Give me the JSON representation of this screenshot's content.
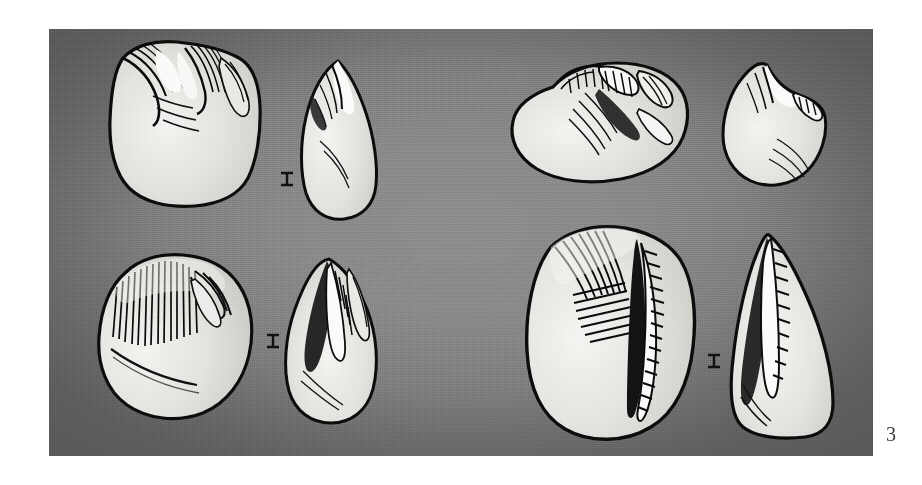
{
  "page": {
    "background_color": "#ffffff",
    "width": 922,
    "height": 485
  },
  "plate": {
    "label": "scientific-illustration-plate",
    "background_color": "#8a8a8a",
    "edge_color": "#686868",
    "x": 49,
    "y": 29,
    "width": 824,
    "height": 427,
    "medium": "stippled pen-and-ink drawing on gray photographic ground",
    "subject": "fossil tooth specimens"
  },
  "figure": {
    "number": "3",
    "number_color": "#3b3b3b"
  },
  "specimens": [
    {
      "id": "specimen-1",
      "position": "top-left",
      "views": [
        {
          "name": "occlusal-view",
          "x": 93,
          "y": 36,
          "width": 185,
          "height": 175,
          "features": "rounded-square crown, hatched wear facets upper margin, dense stipple lower right"
        },
        {
          "name": "lateral-view",
          "x": 290,
          "y": 55,
          "width": 90,
          "height": 165,
          "features": "pointed apex, tall narrow profile, stipple shading right side"
        }
      ],
      "connector": {
        "name": "view-link-mark",
        "x": 277,
        "y": 151,
        "width": 15,
        "height": 10
      }
    },
    {
      "id": "specimen-2",
      "position": "top-right",
      "views": [
        {
          "name": "occlusal-view",
          "x": 502,
          "y": 52,
          "width": 190,
          "height": 130,
          "features": "oval crown, complex crenulated crest across upper half, stipple lower left"
        },
        {
          "name": "lateral-view",
          "x": 717,
          "y": 58,
          "width": 113,
          "height": 130,
          "features": "peaked apex with notched cusp row, stipple concentrated lower right"
        }
      ],
      "connector": null
    },
    {
      "id": "specimen-3",
      "position": "bottom-left",
      "views": [
        {
          "name": "occlusal-view",
          "x": 80,
          "y": 250,
          "width": 190,
          "height": 170,
          "features": "irregular rounded outline, long parallel striations upper left, heavy stipple lower right"
        },
        {
          "name": "lateral-view",
          "x": 275,
          "y": 258,
          "width": 110,
          "height": 165,
          "features": "leaf-shaped, deep dark groove along left edge, stipple right"
        }
      ],
      "connector": {
        "name": "view-link-mark",
        "x": 266,
        "y": 335,
        "width": 14,
        "height": 9
      }
    },
    {
      "id": "specimen-4",
      "position": "bottom-right",
      "views": [
        {
          "name": "occlusal-view",
          "x": 500,
          "y": 225,
          "width": 215,
          "height": 215,
          "features": "largest specimen, broad crown, fan of hatching upper centre, bold vertical ridge with comb hatching right of centre, fine stipple overall"
        },
        {
          "name": "lateral-view",
          "x": 727,
          "y": 233,
          "width": 118,
          "height": 205,
          "features": "triangular profile, long hatched crest down left edge, dense stipple right margin"
        }
      ],
      "connector": {
        "name": "view-link-mark",
        "x": 715,
        "y": 355,
        "width": 14,
        "height": 9
      }
    }
  ]
}
